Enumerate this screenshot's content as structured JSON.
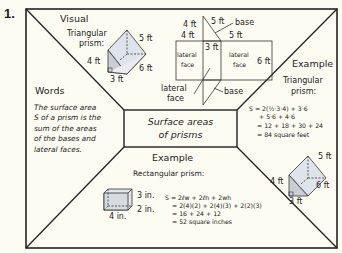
{
  "problem_number": "1.",
  "center": {
    "line1": "Surface areas",
    "line2": "of prisms"
  },
  "visual": {
    "heading": "Visual",
    "prism_label_line1": "Triangular",
    "prism_label_line2": "prism:",
    "dims": {
      "a": "5 ft",
      "b": "4 ft",
      "c": "6 ft",
      "d": "3 ft"
    }
  },
  "net": {
    "left_top": "4 ft",
    "left_top2": "4 ft",
    "top_slant": "5 ft",
    "base_top": "base",
    "right_top": "5 ft",
    "middle": "3 ft",
    "lateral_left_1": "lateral",
    "lateral_left_2": "face",
    "lateral_right_1": "lateral",
    "lateral_right_2": "face",
    "right_side": "6 ft",
    "pointer_lateral_1": "lateral",
    "pointer_lateral_2": "face",
    "base_bottom": "base"
  },
  "words": {
    "heading": "Words",
    "lines": [
      "The surface area",
      "S of a prism is the",
      "sum of the areas",
      "of the bases and",
      "lateral faces."
    ]
  },
  "example_right": {
    "heading": "Example",
    "sub1": "Triangular",
    "sub2": "prism:",
    "lines": [
      "S = 2(½·3·4) + 3·6",
      "+ 5·6 + 4·6",
      "= 12 + 18 + 30 + 24",
      "= 84 square feet"
    ],
    "dims": {
      "a": "5 ft",
      "b": "4 ft",
      "c": "6 ft",
      "d": "3 ft"
    }
  },
  "example_bottom": {
    "heading": "Example",
    "sub": "Rectangular prism:",
    "dims": {
      "h": "3 in.",
      "w": "2 in.",
      "l": "4 in."
    },
    "lines": [
      "S = 2ℓw + 2ℓh + 2wh",
      "= 2(4)(2) + 2(4)(3) + 2(2)(3)",
      "= 16 + 24 + 12",
      "= 52 square inches"
    ]
  }
}
